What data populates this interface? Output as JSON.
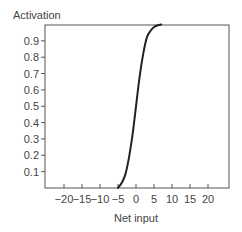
{
  "chart_data": {
    "type": "line",
    "title": "",
    "xlabel": "Net input",
    "ylabel": "Activation",
    "xlim": [
      -25,
      26
    ],
    "ylim": [
      0,
      1.0
    ],
    "grid": false,
    "legend": null,
    "x_ticks": [
      -20,
      -15,
      -10,
      -5,
      0,
      5,
      10,
      15,
      20
    ],
    "x_tick_labels": [
      "−20",
      "−15",
      "−10",
      "−5",
      "0",
      "5",
      "10",
      "15",
      "20"
    ],
    "y_ticks": [
      0.1,
      0.2,
      0.3,
      0.4,
      0.5,
      0.6,
      0.7,
      0.8,
      0.9
    ],
    "y_tick_labels": [
      "0.1",
      "0.2",
      "0.3",
      "0.4",
      "0.5",
      "0.6",
      "0.7",
      "0.8",
      "0.9"
    ],
    "series": [
      {
        "name": "Activation function (sigmoid)",
        "color": "#222222",
        "x": [
          -5,
          -4,
          -3,
          -2,
          -1,
          0,
          1,
          2,
          3,
          4,
          5,
          6,
          7
        ],
        "y": [
          0.0,
          0.03,
          0.08,
          0.18,
          0.32,
          0.5,
          0.68,
          0.82,
          0.92,
          0.96,
          0.985,
          0.995,
          1.0
        ]
      }
    ]
  }
}
